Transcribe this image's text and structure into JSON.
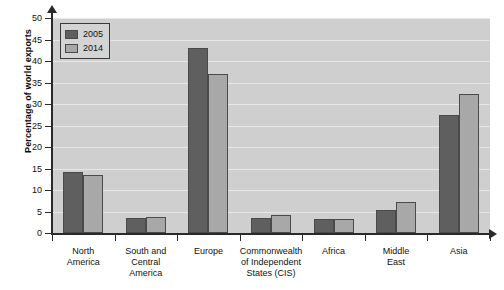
{
  "chart_data": {
    "type": "bar",
    "title": "",
    "xlabel": "",
    "ylabel": "Percentage of world exports",
    "ylim": [
      0,
      50
    ],
    "ytick_step": 5,
    "yticks": [
      0,
      5,
      10,
      15,
      20,
      25,
      30,
      35,
      40,
      45,
      50
    ],
    "grid": true,
    "legend_position": "top-left",
    "categories": [
      "North America",
      "South and Central America",
      "Europe",
      "Commonwealth of Independent States (CIS)",
      "Africa",
      "Middle East",
      "Asia"
    ],
    "category_label_lines": [
      [
        "North",
        "America"
      ],
      [
        "South and",
        "Central",
        "America"
      ],
      [
        "Europe"
      ],
      [
        "Commonwealth",
        "of Independent",
        "States (CIS)"
      ],
      [
        "Africa"
      ],
      [
        "Middle",
        "East"
      ],
      [
        "Asia"
      ]
    ],
    "series": [
      {
        "name": "2005",
        "color": "#5f5f5f",
        "values": [
          14.3,
          3.5,
          43.0,
          3.6,
          3.2,
          5.4,
          27.5
        ]
      },
      {
        "name": "2014",
        "color": "#a8a8a8",
        "values": [
          13.5,
          3.8,
          37.0,
          4.2,
          3.2,
          7.2,
          32.3
        ]
      }
    ]
  },
  "legend": {
    "items": [
      {
        "label": "2005",
        "color": "#5f5f5f"
      },
      {
        "label": "2014",
        "color": "#a8a8a8"
      }
    ]
  },
  "axes": {
    "y_title": "Percentage of world exports"
  },
  "colors": {
    "plot_background": "#cfcfcf",
    "gridline": "#e7e7e7",
    "axis": "#2a2a2a",
    "series_2005": "#5f5f5f",
    "series_2014": "#a8a8a8",
    "page_background": "#ffffff"
  }
}
